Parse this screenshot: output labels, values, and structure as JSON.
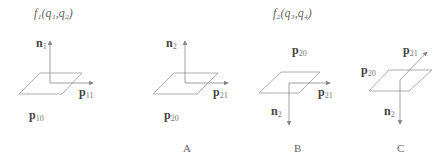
{
  "titles": {
    "f1": "f₁(q₁,q₂)",
    "f2": "f₂(q₃,q₄)"
  },
  "figures": [
    {
      "id": "f1",
      "labels": {
        "normal": {
          "base": "n",
          "sub": "1"
        },
        "axis": {
          "base": "p",
          "sub": "11"
        },
        "point": {
          "base": "p",
          "sub": "10"
        }
      },
      "caption": ""
    },
    {
      "id": "A",
      "labels": {
        "normal": {
          "base": "n",
          "sub": "2"
        },
        "axis": {
          "base": "p",
          "sub": "21"
        },
        "point": {
          "base": "p",
          "sub": "20"
        }
      },
      "caption": "A"
    },
    {
      "id": "B",
      "labels": {
        "point": {
          "base": "p",
          "sub": "20"
        },
        "axis": {
          "base": "p",
          "sub": "21"
        },
        "normal": {
          "base": "n",
          "sub": "2"
        }
      },
      "caption": "B"
    },
    {
      "id": "C",
      "labels": {
        "axis": {
          "base": "p",
          "sub": "21"
        },
        "point": {
          "base": "p",
          "sub": "20"
        },
        "normal": {
          "base": "n",
          "sub": "2"
        }
      },
      "caption": "C"
    }
  ],
  "colors": {
    "line": "#888888",
    "text": "#444444"
  }
}
